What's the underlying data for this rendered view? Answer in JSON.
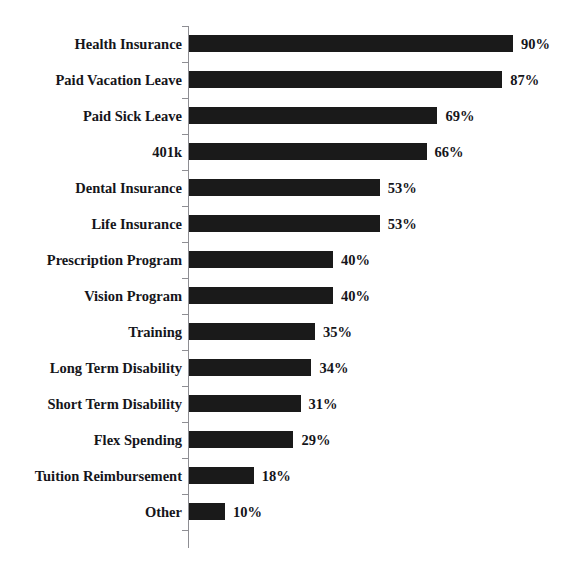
{
  "chart_data": {
    "type": "bar",
    "orientation": "horizontal",
    "title": "",
    "title_note": "chart title is cropped off the top edge of the screenshot and is not legible",
    "xlabel": "",
    "ylabel": "",
    "xlim": [
      0,
      100
    ],
    "grid": false,
    "legend": false,
    "value_suffix": "%",
    "bar_color": "#1a1a1a",
    "axis_color": "#8e8e93",
    "background_color": "#ffffff",
    "categories": [
      "Health Insurance",
      "Paid Vacation Leave",
      "Paid Sick Leave",
      "401k",
      "Dental Insurance",
      "Life Insurance",
      "Prescription Program",
      "Vision Program",
      "Training",
      "Long Term Disability",
      "Short Term Disability",
      "Flex Spending",
      "Tuition Reimbursement",
      "Other"
    ],
    "values": [
      90,
      87,
      69,
      66,
      53,
      53,
      40,
      40,
      35,
      34,
      31,
      29,
      18,
      10
    ],
    "value_labels": [
      "90%",
      "87%",
      "69%",
      "66%",
      "53%",
      "53%",
      "40%",
      "40%",
      "35%",
      "34%",
      "31%",
      "29%",
      "18%",
      "10%"
    ]
  }
}
